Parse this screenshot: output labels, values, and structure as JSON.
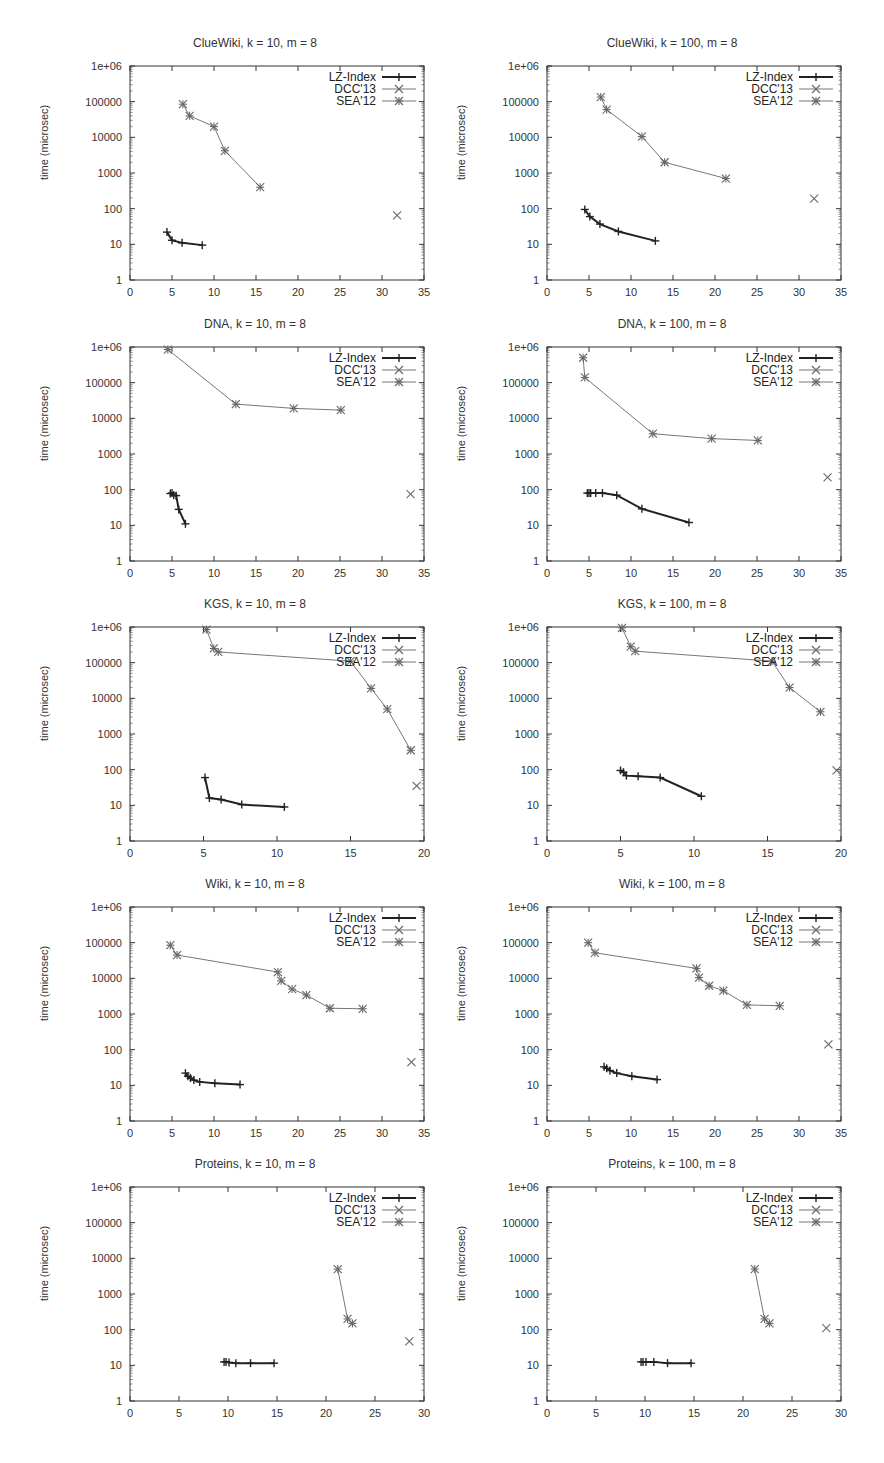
{
  "figure": {
    "ylabel": "time (microsec)",
    "legend": [
      "LZ-Index",
      "DCC'13",
      "SEA'12"
    ]
  },
  "chart_data": [
    {
      "type": "line",
      "title": "ClueWiki, k = 10, m = 8",
      "xlabel": "",
      "ylabel": "time (microsec)",
      "xlim": [
        0,
        35
      ],
      "xticks": [
        0,
        5,
        10,
        15,
        20,
        25,
        30,
        35
      ],
      "ylim": [
        1,
        1000000
      ],
      "yscale": "log",
      "yticks": [
        "1",
        "10",
        "100",
        "1000",
        "10000",
        "100000",
        "1e+06"
      ],
      "legend_position": "top-right",
      "series": [
        {
          "name": "LZ-Index",
          "points": [
            [
              4.4,
              22
            ],
            [
              5.0,
              13
            ],
            [
              6.2,
              11
            ],
            [
              8.6,
              9.5
            ]
          ]
        },
        {
          "name": "DCC'13",
          "points": [
            [
              31.8,
              65
            ]
          ]
        },
        {
          "name": "SEA'12",
          "points": [
            [
              6.3,
              85000
            ],
            [
              7.1,
              40000
            ],
            [
              10.0,
              20000
            ],
            [
              11.3,
              4200
            ],
            [
              15.5,
              400
            ]
          ]
        }
      ]
    },
    {
      "type": "line",
      "title": "ClueWiki, k = 100, m = 8",
      "xlabel": "",
      "ylabel": "time (microsec)",
      "xlim": [
        0,
        35
      ],
      "xticks": [
        0,
        5,
        10,
        15,
        20,
        25,
        30,
        35
      ],
      "ylim": [
        1,
        1000000
      ],
      "yscale": "log",
      "yticks": [
        "1",
        "10",
        "100",
        "1000",
        "10000",
        "100000",
        "1e+06"
      ],
      "legend_position": "top-right",
      "series": [
        {
          "name": "LZ-Index",
          "points": [
            [
              4.5,
              95
            ],
            [
              5.1,
              60
            ],
            [
              6.3,
              37
            ],
            [
              8.5,
              23
            ],
            [
              12.9,
              12.5
            ]
          ]
        },
        {
          "name": "DCC'13",
          "points": [
            [
              31.8,
              190
            ]
          ]
        },
        {
          "name": "SEA'12",
          "points": [
            [
              6.4,
              135000
            ],
            [
              7.1,
              60000
            ],
            [
              11.3,
              10500
            ],
            [
              14.0,
              2000
            ],
            [
              21.3,
              700
            ]
          ]
        }
      ]
    },
    {
      "type": "line",
      "title": "DNA, k = 10, m = 8",
      "xlabel": "",
      "ylabel": "time (microsec)",
      "xlim": [
        0,
        35
      ],
      "xticks": [
        0,
        5,
        10,
        15,
        20,
        25,
        30,
        35
      ],
      "ylim": [
        1,
        1000000
      ],
      "yscale": "log",
      "yticks": [
        "1",
        "10",
        "100",
        "1000",
        "10000",
        "100000",
        "1e+06"
      ],
      "legend_position": "top-right",
      "series": [
        {
          "name": "LZ-Index",
          "points": [
            [
              4.8,
              78
            ],
            [
              5.0,
              80
            ],
            [
              5.2,
              70
            ],
            [
              5.5,
              68
            ],
            [
              5.8,
              28
            ],
            [
              6.6,
              11
            ]
          ]
        },
        {
          "name": "DCC'13",
          "points": [
            [
              33.4,
              75
            ]
          ]
        },
        {
          "name": "SEA'12",
          "points": [
            [
              4.5,
              850000
            ],
            [
              12.6,
              25000
            ],
            [
              19.5,
              19000
            ],
            [
              25.1,
              17000
            ]
          ]
        }
      ]
    },
    {
      "type": "line",
      "title": "DNA, k = 100, m = 8",
      "xlabel": "",
      "ylabel": "time (microsec)",
      "xlim": [
        0,
        35
      ],
      "xticks": [
        0,
        5,
        10,
        15,
        20,
        25,
        30,
        35
      ],
      "ylim": [
        1,
        1000000
      ],
      "yscale": "log",
      "yticks": [
        "1",
        "10",
        "100",
        "1000",
        "10000",
        "100000",
        "1e+06"
      ],
      "legend_position": "top-right",
      "series": [
        {
          "name": "LZ-Index",
          "points": [
            [
              4.8,
              80
            ],
            [
              5.0,
              80
            ],
            [
              5.2,
              80
            ],
            [
              5.8,
              80
            ],
            [
              6.6,
              80
            ],
            [
              8.3,
              70
            ],
            [
              11.3,
              29
            ],
            [
              16.9,
              12
            ]
          ]
        },
        {
          "name": "DCC'13",
          "points": [
            [
              33.4,
              220
            ]
          ]
        },
        {
          "name": "SEA'12",
          "points": [
            [
              4.3,
              500000
            ],
            [
              4.5,
              140000
            ],
            [
              12.6,
              3700
            ],
            [
              19.6,
              2700
            ],
            [
              25.1,
              2400
            ]
          ]
        }
      ]
    },
    {
      "type": "line",
      "title": "KGS, k = 10, m = 8",
      "xlabel": "",
      "ylabel": "time (microsec)",
      "xlim": [
        0,
        20
      ],
      "xticks": [
        0,
        5,
        10,
        15,
        20
      ],
      "ylim": [
        1,
        1000000
      ],
      "yscale": "log",
      "yticks": [
        "1",
        "10",
        "100",
        "1000",
        "10000",
        "100000",
        "1e+06"
      ],
      "legend_position": "top-right",
      "series": [
        {
          "name": "LZ-Index",
          "points": [
            [
              5.1,
              60
            ],
            [
              5.4,
              16
            ],
            [
              6.2,
              14.5
            ],
            [
              7.6,
              10.5
            ],
            [
              10.5,
              9
            ]
          ]
        },
        {
          "name": "DCC'13",
          "points": [
            [
              19.5,
              35
            ]
          ]
        },
        {
          "name": "SEA'12",
          "points": [
            [
              5.2,
              850000
            ],
            [
              5.7,
              250000
            ],
            [
              6.0,
              200000
            ],
            [
              15.0,
              110000
            ],
            [
              16.4,
              19000
            ],
            [
              17.5,
              5000
            ],
            [
              19.1,
              350
            ]
          ]
        }
      ]
    },
    {
      "type": "line",
      "title": "KGS, k = 100, m = 8",
      "xlabel": "",
      "ylabel": "time (microsec)",
      "xlim": [
        0,
        20
      ],
      "xticks": [
        0,
        5,
        10,
        15,
        20
      ],
      "ylim": [
        1,
        1000000
      ],
      "yscale": "log",
      "yticks": [
        "1",
        "10",
        "100",
        "1000",
        "10000",
        "100000",
        "1e+06"
      ],
      "legend_position": "top-right",
      "series": [
        {
          "name": "LZ-Index",
          "points": [
            [
              5.0,
              95
            ],
            [
              5.2,
              85
            ],
            [
              5.4,
              68
            ],
            [
              6.2,
              65
            ],
            [
              7.7,
              60
            ],
            [
              10.5,
              18
            ]
          ]
        },
        {
          "name": "DCC'13",
          "points": [
            [
              19.7,
              95
            ]
          ]
        },
        {
          "name": "SEA'12",
          "points": [
            [
              5.1,
              950000
            ],
            [
              5.7,
              280000
            ],
            [
              6.0,
              210000
            ],
            [
              15.3,
              110000
            ],
            [
              16.5,
              20000
            ],
            [
              18.6,
              4200
            ]
          ]
        }
      ]
    },
    {
      "type": "line",
      "title": "Wiki, k = 10, m = 8",
      "xlabel": "",
      "ylabel": "time (microsec)",
      "xlim": [
        0,
        35
      ],
      "xticks": [
        0,
        5,
        10,
        15,
        20,
        25,
        30,
        35
      ],
      "ylim": [
        1,
        1000000
      ],
      "yscale": "log",
      "yticks": [
        "1",
        "10",
        "100",
        "1000",
        "10000",
        "100000",
        "1e+06"
      ],
      "legend_position": "top-right",
      "series": [
        {
          "name": "LZ-Index",
          "points": [
            [
              6.6,
              22
            ],
            [
              6.9,
              18
            ],
            [
              7.2,
              16
            ],
            [
              7.6,
              14
            ],
            [
              8.3,
              12.5
            ],
            [
              10.1,
              11.5
            ],
            [
              13.1,
              10.5
            ]
          ]
        },
        {
          "name": "DCC'13",
          "points": [
            [
              33.5,
              45
            ]
          ]
        },
        {
          "name": "SEA'12",
          "points": [
            [
              4.8,
              85000
            ],
            [
              5.6,
              45000
            ],
            [
              17.6,
              15000
            ],
            [
              18.0,
              8500
            ],
            [
              19.3,
              5000
            ],
            [
              21.0,
              3400
            ],
            [
              23.8,
              1450
            ],
            [
              27.7,
              1400
            ]
          ]
        }
      ]
    },
    {
      "type": "line",
      "title": "Wiki, k = 100, m = 8",
      "xlabel": "",
      "ylabel": "time (microsec)",
      "xlim": [
        0,
        35
      ],
      "xticks": [
        0,
        5,
        10,
        15,
        20,
        25,
        30,
        35
      ],
      "ylim": [
        1,
        1000000
      ],
      "yscale": "log",
      "yticks": [
        "1",
        "10",
        "100",
        "1000",
        "10000",
        "100000",
        "1e+06"
      ],
      "legend_position": "top-right",
      "series": [
        {
          "name": "LZ-Index",
          "points": [
            [
              6.8,
              33
            ],
            [
              7.1,
              30
            ],
            [
              7.5,
              26
            ],
            [
              8.3,
              22
            ],
            [
              10.1,
              18
            ],
            [
              13.1,
              14.5
            ]
          ]
        },
        {
          "name": "DCC'13",
          "points": [
            [
              33.5,
              140
            ]
          ]
        },
        {
          "name": "SEA'12",
          "points": [
            [
              4.9,
              100000
            ],
            [
              5.7,
              52000
            ],
            [
              17.8,
              19000
            ],
            [
              18.1,
              10500
            ],
            [
              19.3,
              6200
            ],
            [
              21.0,
              4500
            ],
            [
              23.8,
              1800
            ],
            [
              27.7,
              1700
            ]
          ]
        }
      ]
    },
    {
      "type": "line",
      "title": "Proteins, k = 10, m = 8",
      "xlabel": "",
      "ylabel": "time (microsec)",
      "xlim": [
        0,
        30
      ],
      "xticks": [
        0,
        5,
        10,
        15,
        20,
        25,
        30
      ],
      "ylim": [
        1,
        1000000
      ],
      "yscale": "log",
      "yticks": [
        "1",
        "10",
        "100",
        "1000",
        "10000",
        "100000",
        "1e+06"
      ],
      "legend_position": "top-right",
      "series": [
        {
          "name": "LZ-Index",
          "points": [
            [
              9.6,
              12.5
            ],
            [
              9.8,
              12.5
            ],
            [
              10.1,
              12
            ],
            [
              10.8,
              11.5
            ],
            [
              12.3,
              11.5
            ],
            [
              14.7,
              11.5
            ]
          ]
        },
        {
          "name": "DCC'13",
          "points": [
            [
              28.5,
              47
            ]
          ]
        },
        {
          "name": "SEA'12",
          "points": [
            [
              21.2,
              5000
            ],
            [
              22.2,
              200
            ],
            [
              22.7,
              150
            ]
          ]
        }
      ]
    },
    {
      "type": "line",
      "title": "Proteins, k = 100, m = 8",
      "xlabel": "",
      "ylabel": "time (microsec)",
      "xlim": [
        0,
        30
      ],
      "xticks": [
        0,
        5,
        10,
        15,
        20,
        25,
        30
      ],
      "ylim": [
        1,
        1000000
      ],
      "yscale": "log",
      "yticks": [
        "1",
        "10",
        "100",
        "1000",
        "10000",
        "100000",
        "1e+06"
      ],
      "legend_position": "top-right",
      "series": [
        {
          "name": "LZ-Index",
          "points": [
            [
              9.6,
              12.5
            ],
            [
              9.8,
              12.5
            ],
            [
              10.1,
              12.5
            ],
            [
              10.9,
              12.5
            ],
            [
              12.3,
              11.5
            ],
            [
              14.7,
              11.5
            ]
          ]
        },
        {
          "name": "DCC'13",
          "points": [
            [
              28.5,
              110
            ]
          ]
        },
        {
          "name": "SEA'12",
          "points": [
            [
              21.2,
              5000
            ],
            [
              22.2,
              200
            ],
            [
              22.7,
              150
            ]
          ]
        }
      ]
    }
  ]
}
